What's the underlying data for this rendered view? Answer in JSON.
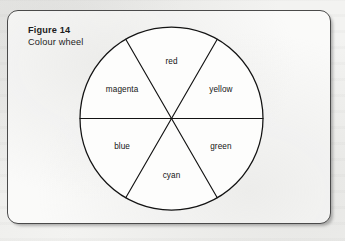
{
  "figure": {
    "number_label": "Figure 14",
    "caption": "Colour wheel"
  },
  "chart_data": {
    "type": "pie",
    "title": "Colour wheel",
    "subtitle": "Figure 14",
    "legend_position": "none",
    "grid": false,
    "equal_slices": true,
    "slice_count": 6,
    "categories": [
      "red",
      "yellow",
      "green",
      "cyan",
      "blue",
      "magenta"
    ],
    "values": [
      1,
      1,
      1,
      1,
      1,
      1
    ],
    "slice_degrees": 60,
    "geometry": {
      "center_x": 171.5,
      "center_y": 118.5,
      "radius": 91.5,
      "divider_angles_deg": [
        0,
        60,
        120
      ],
      "label_radius": 57
    },
    "slices": [
      {
        "label": "red",
        "start_deg": 60,
        "end_deg": 120,
        "mid_deg": 90,
        "label_x": 171.5,
        "label_y": 61.5,
        "fill": "none"
      },
      {
        "label": "yellow",
        "start_deg": 0,
        "end_deg": 60,
        "mid_deg": 30,
        "label_x": 220.9,
        "label_y": 90.0,
        "fill": "none"
      },
      {
        "label": "green",
        "start_deg": 300,
        "end_deg": 360,
        "mid_deg": 330,
        "label_x": 220.9,
        "label_y": 147.0,
        "fill": "none"
      },
      {
        "label": "cyan",
        "start_deg": 240,
        "end_deg": 300,
        "mid_deg": 270,
        "label_x": 171.5,
        "label_y": 175.5,
        "fill": "none"
      },
      {
        "label": "blue",
        "start_deg": 180,
        "end_deg": 240,
        "mid_deg": 210,
        "label_x": 122.1,
        "label_y": 147.0,
        "fill": "none"
      },
      {
        "label": "magenta",
        "start_deg": 120,
        "end_deg": 180,
        "mid_deg": 150,
        "label_x": 122.1,
        "label_y": 90.0,
        "fill": "none"
      }
    ],
    "colors": {
      "outline": "#131313",
      "divider": "#131313",
      "label_text": "#141414",
      "face": "#fdfdfc"
    }
  }
}
